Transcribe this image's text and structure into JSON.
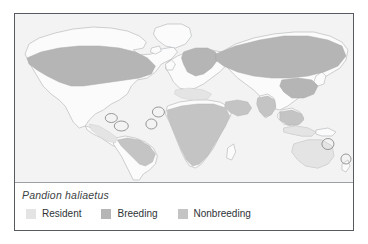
{
  "figure": {
    "species": "Pandion haliaetus",
    "frame_color": "#555b60",
    "map_background": "#f1f1f1",
    "panel_background": "#ffffff"
  },
  "legend": {
    "items": [
      {
        "label": "Resident",
        "color": "#e4e4e4"
      },
      {
        "label": "Breeding",
        "color": "#b5b5b5"
      },
      {
        "label": "Nonbreeding",
        "color": "#c4c4c4"
      }
    ]
  },
  "map": {
    "ocean_color": "#f3f3f3",
    "land_outline_color": "#b9bcbe",
    "land_fill_color": "#fbfbfb",
    "annotation_circle_color": "#8a8d8f"
  }
}
